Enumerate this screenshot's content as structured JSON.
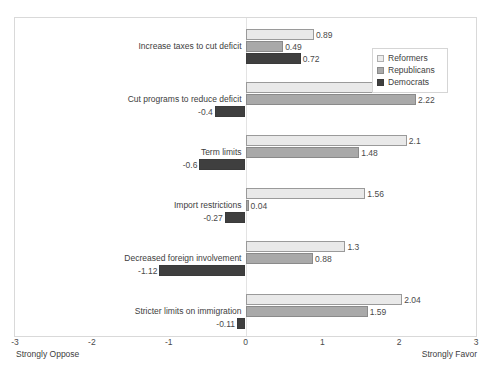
{
  "chart_data": {
    "type": "bar",
    "orientation": "horizontal",
    "title": "",
    "xlabel": "",
    "ylabel": "",
    "xlim": [
      -3,
      3
    ],
    "xticks": [
      -3,
      -2,
      -1,
      0,
      1,
      2,
      3
    ],
    "xtick_labels": [
      "-3",
      "-2",
      "-1",
      "0",
      "1",
      "2",
      "3"
    ],
    "axis_end_labels": {
      "left": "Strongly Oppose",
      "right": "Strongly Favor"
    },
    "grid": false,
    "legend_position": "top-right",
    "categories": [
      "Increase taxes to cut deficit",
      "Cut programs to reduce deficit",
      "Term limits",
      "Import restrictions",
      "Decreased foreign involvement",
      "Stricter limits on immigration"
    ],
    "series": [
      {
        "name": "Reformers",
        "color": "#e9e9e9",
        "values": [
          0.89,
          1.93,
          2.1,
          1.56,
          1.3,
          2.04
        ]
      },
      {
        "name": "Republicans",
        "color": "#a9a9a9",
        "values": [
          0.49,
          2.22,
          1.48,
          0.04,
          0.88,
          1.59
        ]
      },
      {
        "name": "Democrats",
        "color": "#3f3f3f",
        "values": [
          0.72,
          -0.4,
          -0.6,
          -0.27,
          -1.12,
          -0.11
        ]
      }
    ],
    "value_labels": [
      [
        "0.89",
        "1.93",
        "2.1",
        "1.56",
        "1.3",
        "2.04"
      ],
      [
        "0.49",
        "2.22",
        "1.48",
        "0.04",
        "0.88",
        "1.59"
      ],
      [
        "0.72",
        "-0.4",
        "-0.6",
        "-0.27",
        "-1.12",
        "-0.11"
      ]
    ]
  },
  "legend": {
    "items": [
      {
        "label": "Reformers"
      },
      {
        "label": "Republicans"
      },
      {
        "label": "Democrats"
      }
    ]
  }
}
